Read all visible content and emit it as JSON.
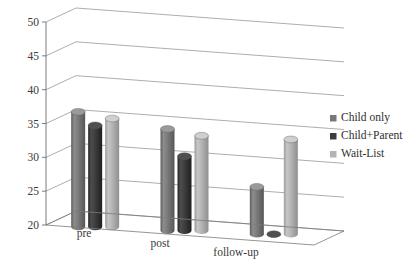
{
  "chart_data": {
    "type": "bar",
    "title": "",
    "subtitle": "",
    "xlabel": "",
    "ylabel": "",
    "categories": [
      "pre",
      "post",
      "follow-up"
    ],
    "series": [
      {
        "name": "Child only",
        "values": [
          37,
          35,
          27
        ],
        "color": "#787878"
      },
      {
        "name": "Child+Parent",
        "values": [
          35,
          31,
          20
        ],
        "color": "#3c3c3c"
      },
      {
        "name": "Wait-List",
        "values": [
          36,
          34,
          34
        ],
        "color": "#b4b4b4"
      }
    ],
    "ylim": [
      20,
      50
    ],
    "yticks": [
      20,
      25,
      30,
      35,
      40,
      45,
      50
    ],
    "ytick_labels": [
      "20",
      "25",
      "30",
      "35",
      "40",
      "45",
      "50"
    ],
    "grid": true,
    "grid_axis": "y",
    "legend_position": "right",
    "style": "3d-cylinder",
    "background": "#ffffff"
  },
  "legend": {
    "items": [
      {
        "label": "Child only",
        "swatch": "#787878"
      },
      {
        "label": "Child+Parent",
        "swatch": "#3c3c3c"
      },
      {
        "label": "Wait-List",
        "swatch": "#b4b4b4"
      }
    ]
  },
  "axes": {
    "y_tick_labels": [
      "50",
      "45",
      "40",
      "35",
      "30",
      "25",
      "20"
    ],
    "x_category_labels": [
      "pre",
      "post",
      "follow-up"
    ]
  }
}
